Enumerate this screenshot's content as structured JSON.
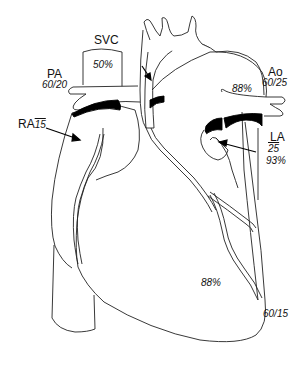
{
  "diagram": {
    "type": "cardiac-anatomy-hemodynamics",
    "stroke_color": "#222222",
    "fill_color": "#ffffff",
    "shade_color": "#000000"
  },
  "labels": {
    "svc": {
      "name": "SVC",
      "saturation": "50%"
    },
    "pa": {
      "name": "PA",
      "pressure": "60/20"
    },
    "ra": {
      "name": "RA",
      "mean_pressure": "15"
    },
    "rv_outflow": {
      "pressure": "60/30"
    },
    "ao": {
      "name": "Ao",
      "pressure": "60/25",
      "saturation": "88%"
    },
    "la": {
      "name": "LA",
      "mean_pressure": "25",
      "saturation": "93%"
    },
    "ventricle": {
      "saturation": "88%",
      "pressure": "60/15"
    }
  }
}
